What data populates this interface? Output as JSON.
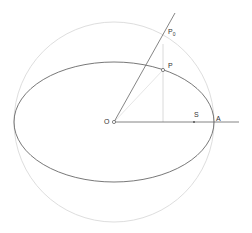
{
  "diagram": {
    "type": "kepler-eccentric-anomaly-construction",
    "colors": {
      "ellipse": "#555555",
      "auxiliary_circle": "#dddddd",
      "lines": "#666666",
      "construction_line": "#cccccc",
      "points": "#555555"
    },
    "labels": {
      "center": "O",
      "point_on_ellipse": "P",
      "point_on_circle": "P",
      "point_on_circle_sub": "0",
      "focus": "S",
      "apsis": "A"
    }
  }
}
